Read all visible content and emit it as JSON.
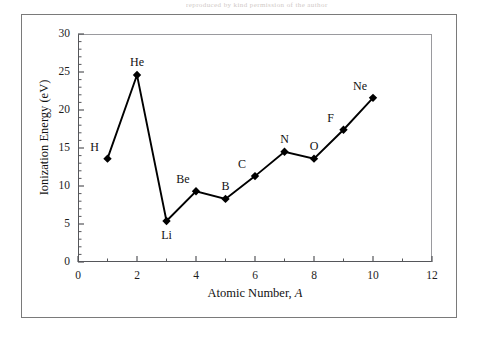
{
  "figure": {
    "scan_artifact_text": "reproduced by kind permission of the author",
    "background_color": "#ffffff",
    "frame_color": "#7a7a7a",
    "axis_color": "#55565a",
    "series_color": "#000000"
  },
  "chart_data": {
    "type": "line",
    "title": "",
    "subtitle": "",
    "xlabel": "Atomic Number, A",
    "xlabel_plain": "Atomic Number, ",
    "xlabel_italic": "A",
    "ylabel": "Ionization Energy (eV)",
    "xlim": [
      0,
      12
    ],
    "ylim": [
      0,
      30
    ],
    "xticks": [
      0,
      2,
      4,
      6,
      8,
      10,
      12
    ],
    "xtick_labels": [
      "0",
      "2",
      "4",
      "6",
      "8",
      "10",
      "12"
    ],
    "xminor_ticks": [
      1,
      3,
      5,
      7,
      9,
      11
    ],
    "yticks": [
      0,
      5,
      10,
      15,
      20,
      25,
      30
    ],
    "ytick_labels": [
      "0",
      "5",
      "10",
      "15",
      "20",
      "25",
      "30"
    ],
    "yminor_ticks": [
      1,
      2,
      3,
      4,
      6,
      7,
      8,
      9,
      11,
      12,
      13,
      14,
      16,
      17,
      18,
      19,
      21,
      22,
      23,
      24,
      26,
      27,
      28,
      29
    ],
    "grid": false,
    "legend": null,
    "marker": "diamond",
    "marker_color": "#000000",
    "line_color": "#000000",
    "x": [
      1,
      2,
      3,
      4,
      5,
      6,
      7,
      8,
      9,
      10
    ],
    "values": [
      13.6,
      24.6,
      5.4,
      9.3,
      8.3,
      11.3,
      14.5,
      13.6,
      17.4,
      21.6
    ],
    "point_labels": [
      "H",
      "He",
      "Li",
      "Be",
      "B",
      "C",
      "N",
      "O",
      "F",
      "Ne"
    ],
    "point_label_positions": [
      "above-left",
      "above",
      "below",
      "above-left",
      "above",
      "above-left",
      "above",
      "above",
      "above-left",
      "above-left"
    ],
    "series": [
      {
        "name": "First ionization energy",
        "x": [
          1,
          2,
          3,
          4,
          5,
          6,
          7,
          8,
          9,
          10
        ],
        "values": [
          13.6,
          24.6,
          5.4,
          9.3,
          8.3,
          11.3,
          14.5,
          13.6,
          17.4,
          21.6
        ],
        "labels": [
          "H",
          "He",
          "Li",
          "Be",
          "B",
          "C",
          "N",
          "O",
          "F",
          "Ne"
        ]
      }
    ]
  }
}
